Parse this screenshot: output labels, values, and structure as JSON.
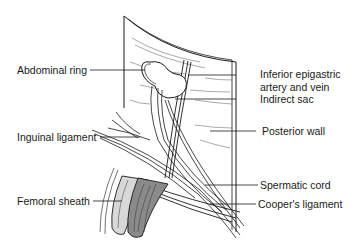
{
  "figure": {
    "type": "anatomical illustration",
    "labels": {
      "left": [
        {
          "id": "abdominal-ring",
          "text": "Abdominal ring"
        },
        {
          "id": "inguinal-ligament",
          "text": "Inguinal ligament"
        },
        {
          "id": "femoral-sheath",
          "text": "Femoral sheath"
        }
      ],
      "right": [
        {
          "id": "inferior-epigastric",
          "text_line1": "Inferior epigastric",
          "text_line2": "artery and vein"
        },
        {
          "id": "indirect-sac",
          "text": "Indirect sac"
        },
        {
          "id": "posterior-wall",
          "text": "Posterior wall"
        },
        {
          "id": "spermatic-cord",
          "text": "Spermatic cord"
        },
        {
          "id": "coopers-ligament",
          "text": "Cooper's ligament"
        }
      ]
    },
    "colors": {
      "line": "#1a1a1a",
      "fill_light": "#d8d8d8",
      "fill_dark": "#8a8a8a",
      "background": "#ffffff"
    }
  }
}
